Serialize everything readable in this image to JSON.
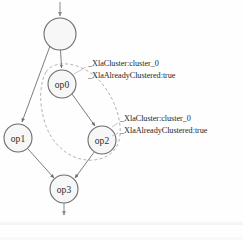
{
  "figure": {
    "nodes": [
      {
        "id": "root",
        "label": "",
        "cx": 60,
        "cy": 34,
        "r": 16
      },
      {
        "id": "op0",
        "label": "op0",
        "cx": 62,
        "cy": 84,
        "r": 14
      },
      {
        "id": "op1",
        "label": "op1",
        "cx": 18,
        "cy": 138,
        "r": 14
      },
      {
        "id": "op2",
        "label": "op2",
        "cx": 102,
        "cy": 140,
        "r": 14
      },
      {
        "id": "op3",
        "label": "op3",
        "cx": 64,
        "cy": 189,
        "r": 14
      }
    ],
    "edges": [
      {
        "from": "root",
        "to": "op0"
      },
      {
        "from": "root",
        "to": "op1"
      },
      {
        "from": "op0",
        "to": "op2"
      },
      {
        "from": "op1",
        "to": "op3"
      },
      {
        "from": "op2",
        "to": "op3"
      }
    ],
    "input_arrow": {
      "x": 60,
      "y_start": 2,
      "y_end": 17
    },
    "output_arrow": {
      "x": 64,
      "y_start": 203,
      "y_end": 216
    },
    "clusters": [
      {
        "id": "cluster_0",
        "contains": [
          "op0",
          "op2"
        ],
        "style": "dashed"
      }
    ],
    "annotations": [
      {
        "id": "annotation-op0",
        "target": "op0",
        "lines": [
          "_XlaCluster:cluster_0",
          "_XlaAlreadyClustered:true"
        ],
        "x": 88,
        "y": 64
      },
      {
        "id": "annotation-op2",
        "target": "op2",
        "lines": [
          "_XlaCluster:cluster_0",
          "_XlaAlreadyClustered:true"
        ],
        "x": 120,
        "y": 119
      }
    ],
    "caption": ""
  },
  "colors": {
    "node_fill": "#f7f7f7",
    "node_stroke": "#6b6b6b",
    "edge_stroke": "#6e6e6e",
    "cluster_stroke": "#a9a9a9",
    "text": "#1f1f1f",
    "background": "#fefefe"
  }
}
